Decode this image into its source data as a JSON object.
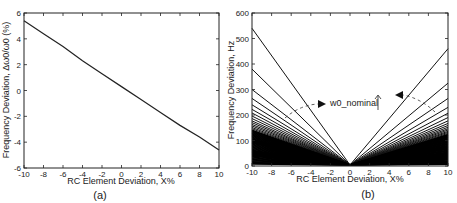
{
  "chart_data": [
    {
      "type": "line",
      "panel": "(a)",
      "title": "",
      "xlabel": "RC Element Deviation, X%",
      "ylabel": "Frequency Deviation, Δω0/ω0 (%)",
      "xlim": [
        -10,
        10
      ],
      "ylim": [
        -6,
        6
      ],
      "xticks": [
        -10,
        -8,
        -6,
        -4,
        -2,
        0,
        2,
        4,
        6,
        8,
        10
      ],
      "yticks": [
        -6,
        -4,
        -2,
        0,
        2,
        4,
        6
      ],
      "grid": false,
      "series": [
        {
          "name": "frequency deviation",
          "x": [
            -10,
            -8,
            -6,
            -4,
            -2,
            0,
            2,
            4,
            6,
            8,
            10
          ],
          "values": [
            5.4,
            4.4,
            3.4,
            2.3,
            1.3,
            0.3,
            -0.7,
            -1.7,
            -2.7,
            -3.6,
            -4.6
          ]
        }
      ]
    },
    {
      "type": "line",
      "panel": "(b)",
      "title": "",
      "xlabel": "RC Element Deviation, X%",
      "ylabel": "Frequency Deviation, Hz",
      "xlim": [
        -10,
        10
      ],
      "ylim": [
        0,
        600
      ],
      "xticks": [
        -10,
        -8,
        -6,
        -4,
        -2,
        0,
        2,
        4,
        6,
        8,
        10
      ],
      "yticks": [
        0,
        100,
        200,
        300,
        400,
        500,
        600
      ],
      "grid": false,
      "annotation": "w0_nominal",
      "series_note": "Family of V-shaped curves, one per nominal frequency; increasing w0_nominal gives steeper curves; curves become dense below ~140 Hz",
      "left_end_values_at_x_minus10": [
        540,
        380,
        300,
        265,
        240,
        222,
        208,
        196,
        186,
        177,
        170,
        163,
        157,
        151,
        146,
        141
      ],
      "right_end_values_at_x_10": [
        460,
        325,
        265,
        230,
        207,
        190,
        177,
        167,
        159,
        152,
        146,
        141,
        136,
        132,
        128,
        124
      ]
    }
  ],
  "panels": {
    "a": {
      "caption": "(a)",
      "xlabel": "RC Element Deviation, X%",
      "ylabel": "Frequency Deviation, Δω0/ω0 (%)",
      "xticks": [
        "-10",
        "-8",
        "-6",
        "-4",
        "-2",
        "0",
        "2",
        "4",
        "6",
        "8",
        "10"
      ],
      "yticks": [
        "-6",
        "-4",
        "-2",
        "0",
        "2",
        "4",
        "6"
      ]
    },
    "b": {
      "caption": "(b)",
      "xlabel": "RC Element Deviation, X%",
      "ylabel": "Frequency Deviation, Hz",
      "xticks": [
        "-10",
        "-8",
        "-6",
        "-4",
        "-2",
        "0",
        "2",
        "4",
        "6",
        "8",
        "10"
      ],
      "yticks": [
        "0",
        "100",
        "200",
        "300",
        "400",
        "500",
        "600"
      ],
      "annotation": "w0_nominal"
    }
  }
}
